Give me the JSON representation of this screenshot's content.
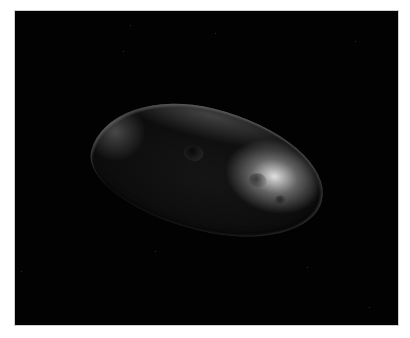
{
  "image": {
    "subject": "irregular elongated moon/asteroid against black space",
    "background_color": "#020202",
    "frame_color": "#ffffff",
    "highlight_color": "#e8e8e8"
  }
}
